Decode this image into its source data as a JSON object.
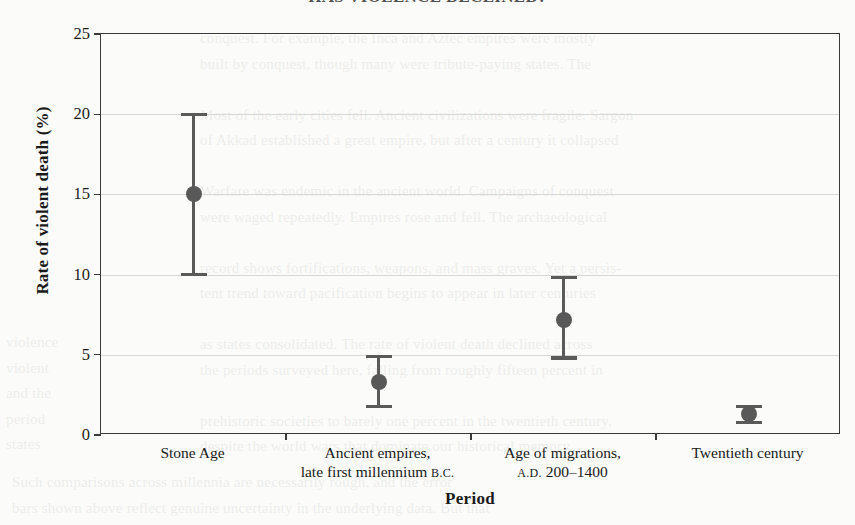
{
  "title": "HAS VIOLENCE DECLINED?",
  "page_showthrough": {
    "right_block": "conquest. For example, the Inca and Aztec empires were mostly\nbuilt by conquest, though many were tribute-paying states. The\n\nMost of the early cities fell. Ancient civilizations were fragile. Sargon\nof Akkad established a great empire, but after a century it collapsed\n\nWarfare was endemic in the ancient world. Campaigns of conquest\nwere waged repeatedly. Empires rose and fell. The archaeological\n\nrecord shows fortifications, weapons, and mass graves. Yet a persis-\ntent trend toward pacification begins to appear in later centuries\n\nas states consolidated. The rate of violent death declined across\nthe periods surveyed here, falling from roughly fifteen percent in\n\nprehistoric societies to barely one percent in the twentieth century,\ndespite the world wars that dominate our historical memory.",
    "left_block": "violence\nviolent\nand the\nperiod\nstates",
    "bottom_block": "Such comparisons across millennia are necessarily rough, and the error\nbars shown above reflect genuine uncertainty in the underlying data. But that"
  },
  "chart_data": {
    "type": "scatter",
    "title": "HAS VIOLENCE DECLINED?",
    "xlabel": "Period",
    "ylabel": "Rate of violent death (%)",
    "ylim": [
      0,
      25
    ],
    "yticks": [
      0,
      5,
      10,
      15,
      20,
      25
    ],
    "ytick_labels": [
      "0",
      "5",
      "10",
      "15",
      "20",
      "25"
    ],
    "grid": true,
    "grid_axis": "y",
    "legend": "none",
    "error_bars": "vertical-capped",
    "marker": "filled-circle",
    "marker_color": "#585858",
    "categories": [
      "Stone Age",
      "Ancient empires, late first millennium B.C.",
      "Age of migrations, A.D. 200–1400",
      "Twentieth century"
    ],
    "category_lines": [
      [
        "Stone Age"
      ],
      [
        "Ancient empires,",
        "late first millennium B.C."
      ],
      [
        "Age of migrations,",
        "A.D. 200–1400"
      ],
      [
        "Twentieth century"
      ]
    ],
    "values": [
      15.0,
      3.3,
      7.2,
      1.3
    ],
    "error_low": [
      10.0,
      1.8,
      4.8,
      0.8
    ],
    "error_high": [
      20.0,
      4.9,
      9.8,
      1.8
    ],
    "points": [
      {
        "category": "Stone Age",
        "value": 15.0,
        "low": 10.0,
        "high": 20.0
      },
      {
        "category": "Ancient empires, late first millennium B.C.",
        "value": 3.3,
        "low": 1.8,
        "high": 4.9
      },
      {
        "category": "Age of migrations, A.D. 200–1400",
        "value": 7.2,
        "low": 4.8,
        "high": 9.8
      },
      {
        "category": "Twentieth century",
        "value": 1.3,
        "low": 0.8,
        "high": 1.8
      }
    ]
  },
  "colors": {
    "page_background": "#fbfbf9",
    "axis": "#3a3a3a",
    "gridline": "#d7d7d7",
    "marker": "#585858",
    "text": "#1a1a1a"
  }
}
